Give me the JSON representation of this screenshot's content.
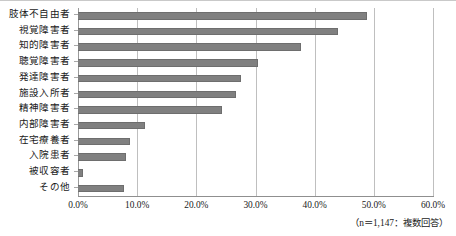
{
  "chart_data": {
    "type": "bar",
    "orientation": "horizontal",
    "title": "",
    "xlabel": "",
    "ylabel": "",
    "xlim": [
      0,
      60
    ],
    "xtick_labels": [
      "0.0%",
      "10.0%",
      "20.0%",
      "30.0%",
      "40.0%",
      "50.0%",
      "60.0%"
    ],
    "xtick_values": [
      0,
      10,
      20,
      30,
      40,
      50,
      60
    ],
    "grid": true,
    "legend": false,
    "categories": [
      "肢体不自由者",
      "視覚障害者",
      "知的障害者",
      "聴覚障害者",
      "発達障害者",
      "施設入所者",
      "精神障害者",
      "内部障害者",
      "在宅療養者",
      "入院患者",
      "被収容者",
      "その他"
    ],
    "values": [
      48.8,
      43.9,
      37.7,
      30.4,
      27.5,
      26.7,
      24.3,
      11.3,
      8.8,
      8.1,
      0.8,
      7.8
    ],
    "bar_color": "#808080",
    "bar_edge_color": "#6e6e6e"
  },
  "footnote": "（n＝1,147：複数回答）"
}
